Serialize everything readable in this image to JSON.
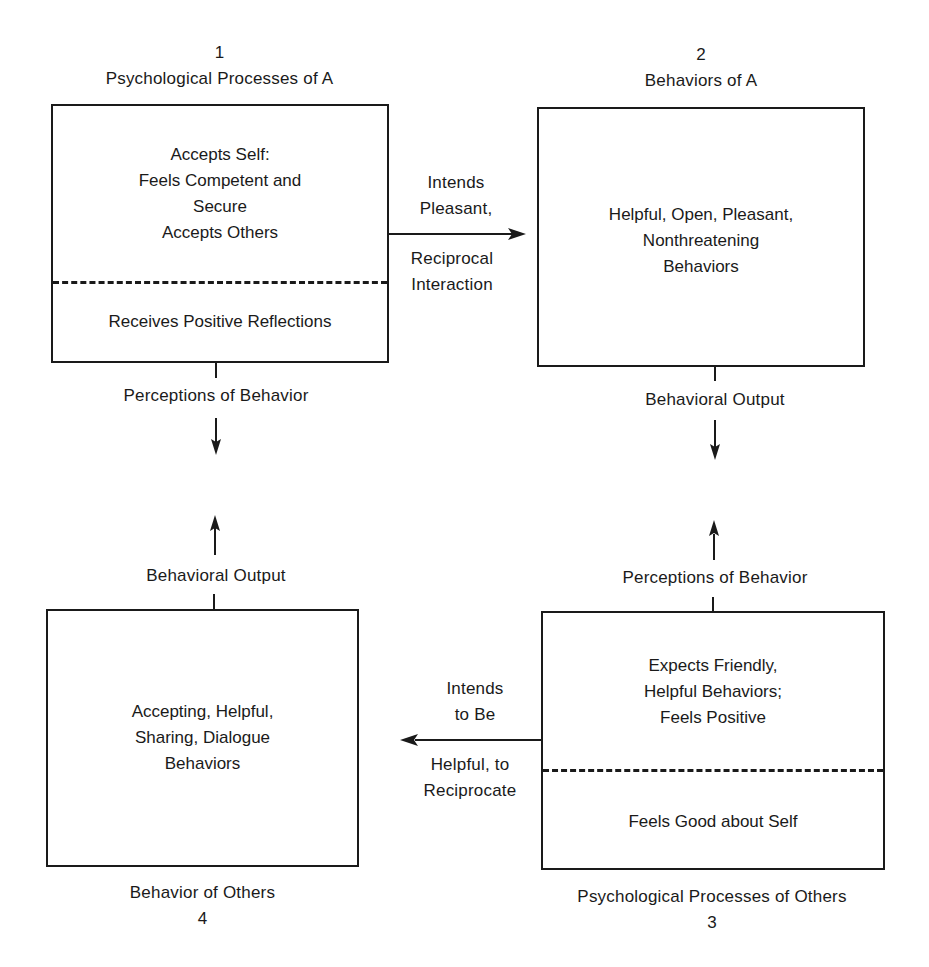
{
  "diagram": {
    "nodes": [
      {
        "id": "1",
        "number": "1",
        "title": "Psychological Processes of A",
        "upper_lines": [
          "Accepts Self:",
          "Feels Competent and",
          "Secure",
          "Accepts Others"
        ],
        "lower_lines": [
          "Receives Positive Reflections"
        ]
      },
      {
        "id": "2",
        "number": "2",
        "title": "Behaviors of A",
        "lines": [
          "Helpful, Open, Pleasant,",
          "Nonthreatening",
          "Behaviors"
        ]
      },
      {
        "id": "3",
        "number": "3",
        "title": "Psychological Processes of Others",
        "upper_lines": [
          "Expects Friendly,",
          "Helpful Behaviors;",
          "Feels Positive"
        ],
        "lower_lines": [
          "Feels Good about Self"
        ]
      },
      {
        "id": "4",
        "number": "4",
        "title": "Behavior of Others",
        "lines": [
          "Accepting, Helpful,",
          "Sharing, Dialogue",
          "Behaviors"
        ]
      }
    ],
    "edges": [
      {
        "from": "1",
        "to": "2",
        "label_above": [
          "Intends",
          "Pleasant,"
        ],
        "label_below": [
          "Reciprocal",
          "Interaction"
        ]
      },
      {
        "from": "2",
        "to": "3",
        "label": "Behavioral Output",
        "label_2": "Perceptions of Behavior"
      },
      {
        "from": "3",
        "to": "4",
        "label_above": [
          "Intends",
          "to Be"
        ],
        "label_below": [
          "Helpful, to",
          "Reciprocate"
        ]
      },
      {
        "from": "4",
        "to": "1",
        "label": "Behavioral Output",
        "label_2": "Perceptions of Behavior"
      }
    ]
  }
}
